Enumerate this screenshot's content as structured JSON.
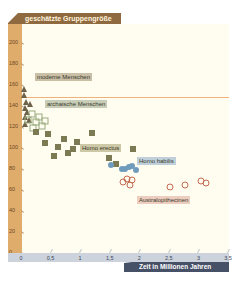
{
  "chart_data": {
    "type": "scatter",
    "title": "geschätzte Gruppengröße",
    "xlabel": "Zeit in Millionen Jahren",
    "ylabel": "geschätzte Gruppengröße",
    "xlim": [
      0,
      3.5
    ],
    "ylim": [
      0,
      210
    ],
    "x_ticks": [
      "0",
      "0,5",
      "1",
      "1,5",
      "2",
      "2,5",
      "3",
      "3,5"
    ],
    "y_ticks": [
      "0",
      "20",
      "40",
      "60",
      "80",
      "100",
      "120",
      "140",
      "160",
      "180",
      "200"
    ],
    "grid": false,
    "reference_line": {
      "y": 148,
      "color": "#f0b27a"
    },
    "series": [
      {
        "name": "moderne Menschen",
        "marker": "triangle",
        "color": "#6e6248",
        "label_bg": "#c9bfa6",
        "points": [
          [
            0.0,
            155
          ],
          [
            0.0,
            150
          ]
        ]
      },
      {
        "name": "archaische Menschen",
        "marker": "triangle",
        "color": "#6e6248",
        "label_bg": "#c8cdb8",
        "points": [
          [
            0.03,
            143
          ],
          [
            0.1,
            141
          ],
          [
            0.02,
            137
          ],
          [
            0.05,
            133
          ],
          [
            0.02,
            129
          ],
          [
            0.08,
            126
          ],
          [
            0.02,
            122
          ]
        ]
      },
      {
        "name": "archaische Menschen (offen)",
        "marker": "open-square",
        "color": "#9aab80",
        "points": [
          [
            0.18,
            131
          ],
          [
            0.3,
            129
          ],
          [
            0.12,
            126
          ],
          [
            0.25,
            124
          ],
          [
            0.4,
            125
          ],
          [
            0.35,
            120
          ],
          [
            0.2,
            118
          ]
        ]
      },
      {
        "name": "Homo erectus",
        "marker": "filled-square",
        "color": "#7c7a52",
        "label_bg": "#cdc8a6",
        "points": [
          [
            0.25,
            114
          ],
          [
            0.45,
            112
          ],
          [
            0.72,
            108
          ],
          [
            0.95,
            105
          ],
          [
            1.2,
            113
          ],
          [
            0.4,
            104
          ],
          [
            0.62,
            100
          ],
          [
            0.8,
            94
          ],
          [
            0.88,
            98
          ],
          [
            1.35,
            99
          ],
          [
            0.55,
            91
          ],
          [
            1.48,
            90
          ],
          [
            1.9,
            98
          ],
          [
            1.6,
            84
          ]
        ]
      },
      {
        "name": "Homo habilis",
        "marker": "filled-circle",
        "color": "#6f9cbc",
        "label_bg": "#bfd0db",
        "points": [
          [
            1.52,
            83
          ],
          [
            1.75,
            79
          ],
          [
            1.82,
            81
          ],
          [
            1.88,
            82
          ],
          [
            1.95,
            78
          ],
          [
            1.7,
            79
          ]
        ]
      },
      {
        "name": "Australopithecinen",
        "marker": "open-circle",
        "color": "#c46a50",
        "label_bg": "#eccdc0",
        "points": [
          [
            1.72,
            67
          ],
          [
            1.8,
            70
          ],
          [
            1.88,
            69
          ],
          [
            1.85,
            64
          ],
          [
            2.52,
            62
          ],
          [
            2.78,
            64
          ],
          [
            3.05,
            68
          ],
          [
            3.12,
            66
          ]
        ]
      }
    ]
  },
  "labels": {
    "title": "geschätzte Gruppengröße",
    "x_title": "Zeit in Millionen Jahren",
    "moderne": "moderne Menschen",
    "archaisch": "archaische Menschen",
    "erectus": "Homo erectus",
    "habilis": "Homo habilis",
    "australo": "Australopithecinen"
  }
}
